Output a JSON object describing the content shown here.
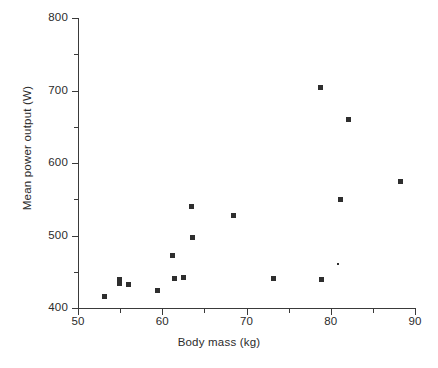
{
  "chart_data": {
    "type": "scatter",
    "title": "",
    "xlabel": "Body mass (kg)",
    "ylabel": "Mean power output  (W)",
    "xlim": [
      50,
      90
    ],
    "ylim": [
      400,
      800
    ],
    "xticks": [
      50,
      60,
      70,
      80,
      90
    ],
    "xticklabels": [
      "50",
      "60",
      "70",
      "80",
      "90"
    ],
    "xminorticks": [
      55,
      65,
      75,
      85
    ],
    "yticks": [
      400,
      500,
      600,
      700,
      800
    ],
    "yticklabels": [
      "400",
      "500",
      "600",
      "700",
      "800"
    ],
    "yminorticks": [
      450,
      550,
      650,
      750
    ],
    "grid": false,
    "legend": null,
    "marker_color": "#2e2e2e",
    "axis_color": "#3a3a3a",
    "points": [
      {
        "x": 53.1,
        "y": 416,
        "size": "normal"
      },
      {
        "x": 54.9,
        "y": 437,
        "size": "tall"
      },
      {
        "x": 56.0,
        "y": 432,
        "size": "normal"
      },
      {
        "x": 59.4,
        "y": 424,
        "size": "normal"
      },
      {
        "x": 61.2,
        "y": 472,
        "size": "normal"
      },
      {
        "x": 61.4,
        "y": 441,
        "size": "normal"
      },
      {
        "x": 62.5,
        "y": 442,
        "size": "normal"
      },
      {
        "x": 63.5,
        "y": 540,
        "size": "normal"
      },
      {
        "x": 63.6,
        "y": 497,
        "size": "normal"
      },
      {
        "x": 68.4,
        "y": 527,
        "size": "normal"
      },
      {
        "x": 73.2,
        "y": 441,
        "size": "normal"
      },
      {
        "x": 78.8,
        "y": 704,
        "size": "normal"
      },
      {
        "x": 78.9,
        "y": 440,
        "size": "normal"
      },
      {
        "x": 80.9,
        "y": 461,
        "size": "tiny"
      },
      {
        "x": 81.2,
        "y": 550,
        "size": "normal"
      },
      {
        "x": 82.1,
        "y": 660,
        "size": "normal"
      },
      {
        "x": 88.3,
        "y": 574,
        "size": "normal"
      }
    ]
  }
}
